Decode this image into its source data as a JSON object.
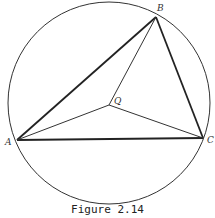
{
  "figure": {
    "caption": "Figure 2.14",
    "circle": {
      "cx": 109,
      "cy": 103,
      "r": 101
    },
    "points": {
      "A": {
        "x": 17,
        "y": 140,
        "label": "A"
      },
      "B": {
        "x": 156,
        "y": 17,
        "label": "B"
      },
      "C": {
        "x": 203,
        "y": 138,
        "label": "C"
      },
      "Q": {
        "x": 109,
        "y": 105,
        "label": "Q"
      }
    },
    "triangle_edges": [
      "AB",
      "BC",
      "CA"
    ],
    "interior_segments": [
      "QA",
      "QB",
      "QC"
    ],
    "colors": {
      "stroke": "#222222",
      "background": "#ffffff"
    }
  }
}
